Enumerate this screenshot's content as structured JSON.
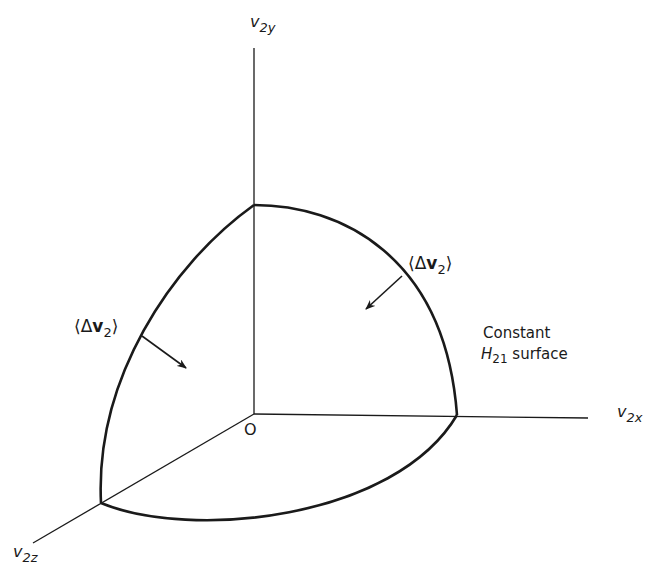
{
  "diagram": {
    "type": "3d-velocity-space-surface",
    "axes": {
      "y": {
        "var": "v",
        "sub": "2y"
      },
      "x": {
        "var": "v",
        "sub": "2x"
      },
      "z": {
        "var": "v",
        "sub": "2z"
      }
    },
    "origin_label": "O",
    "flux_labels": [
      {
        "open": "⟨",
        "delta": "Δ",
        "var": "v",
        "sub": "2",
        "close": "⟩",
        "position": "upper-right"
      },
      {
        "open": "⟨",
        "delta": "Δ",
        "var": "v",
        "sub": "2",
        "close": "⟩",
        "position": "left"
      }
    ],
    "surface_label": {
      "line1": "Constant",
      "line2_var": "H",
      "line2_sub": "21",
      "line2_rest": "surface"
    },
    "colors": {
      "stroke": "#1a1a1a",
      "background": "#ffffff"
    }
  }
}
